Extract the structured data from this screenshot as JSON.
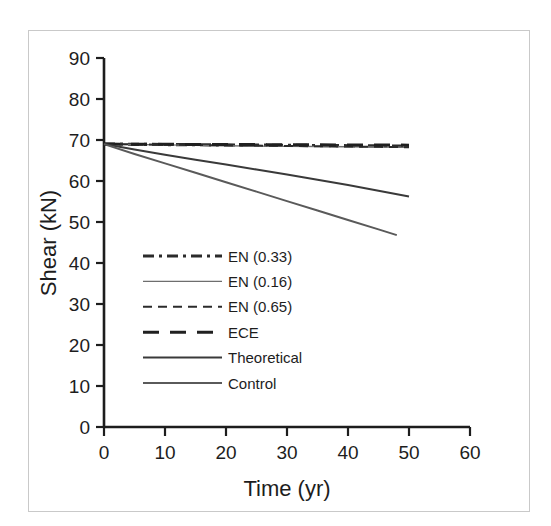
{
  "chart_data": {
    "type": "line",
    "title": "",
    "xlabel": "Time (yr)",
    "ylabel": "Shear (kN)",
    "xlim": [
      0,
      60
    ],
    "ylim": [
      0,
      90
    ],
    "xticks": [
      0,
      10,
      20,
      30,
      40,
      50,
      60
    ],
    "yticks": [
      0,
      10,
      20,
      30,
      40,
      50,
      60,
      70,
      80,
      90
    ],
    "grid": false,
    "legend_position": "inside-lower-left",
    "series": [
      {
        "name": "EN (0.33)",
        "style": "dash-dot",
        "color": "#2b2b2b",
        "width": 3.2,
        "x": [
          0,
          5,
          10,
          15,
          20,
          25,
          30,
          35,
          40,
          45,
          50
        ],
        "y": [
          69.0,
          68.95,
          68.9,
          68.85,
          68.8,
          68.75,
          68.7,
          68.65,
          68.6,
          68.55,
          68.5
        ]
      },
      {
        "name": "EN (0.16)",
        "style": "solid",
        "color": "#6e6e6e",
        "width": 1.4,
        "x": [
          0,
          5,
          10,
          15,
          20,
          25,
          30,
          35,
          40,
          45,
          50
        ],
        "y": [
          69.0,
          68.9,
          68.8,
          68.7,
          68.6,
          68.5,
          68.45,
          68.4,
          68.35,
          68.3,
          68.25
        ]
      },
      {
        "name": "EN (0.65)",
        "style": "dashed",
        "color": "#2b2b2b",
        "width": 2.0,
        "x": [
          0,
          5,
          10,
          15,
          20,
          25,
          30,
          35,
          40,
          45,
          50
        ],
        "y": [
          69.0,
          68.92,
          68.85,
          68.78,
          68.7,
          68.63,
          68.55,
          68.48,
          68.4,
          68.33,
          68.25
        ]
      },
      {
        "name": "ECE",
        "style": "long-dash",
        "color": "#202020",
        "width": 3.0,
        "x": [
          0,
          5,
          10,
          15,
          20,
          25,
          30,
          35,
          40,
          45,
          50
        ],
        "y": [
          69.0,
          68.98,
          68.95,
          68.92,
          68.9,
          68.87,
          68.85,
          68.82,
          68.8,
          68.77,
          68.75
        ]
      },
      {
        "name": "Theoretical",
        "style": "solid",
        "color": "#3a3a3a",
        "width": 2.0,
        "x": [
          0,
          5,
          10,
          15,
          20,
          25,
          30,
          35,
          40,
          45,
          50
        ],
        "y": [
          69.0,
          67.7,
          66.4,
          65.2,
          64.0,
          62.8,
          61.6,
          60.3,
          59.0,
          57.6,
          56.2
        ]
      },
      {
        "name": "Control",
        "style": "solid",
        "color": "#5a5a5a",
        "width": 2.0,
        "x": [
          0,
          5,
          10,
          15,
          20,
          25,
          30,
          35,
          40,
          45,
          48
        ],
        "y": [
          69.0,
          66.6,
          64.3,
          62.0,
          59.7,
          57.4,
          55.1,
          52.8,
          50.5,
          48.2,
          46.8
        ]
      }
    ]
  },
  "axes": {
    "x_tick_labels": [
      "0",
      "10",
      "20",
      "30",
      "40",
      "50",
      "60"
    ],
    "y_tick_labels": [
      "0",
      "10",
      "20",
      "30",
      "40",
      "50",
      "60",
      "70",
      "80",
      "90"
    ],
    "x_axis_title": "Time (yr)",
    "y_axis_title": "Shear (kN)"
  },
  "legend": {
    "entries": [
      {
        "label": "EN (0.33)",
        "style": "dash-dot"
      },
      {
        "label": "EN (0.16)",
        "style": "solid-thin"
      },
      {
        "label": "EN (0.65)",
        "style": "dashed"
      },
      {
        "label": "ECE",
        "style": "long-dash"
      },
      {
        "label": "Theoretical",
        "style": "solid"
      },
      {
        "label": "Control",
        "style": "solid-gray"
      }
    ]
  },
  "colors": {
    "border": "#c9c9c9",
    "axis": "#1d1d1d",
    "background": "#ffffff"
  }
}
